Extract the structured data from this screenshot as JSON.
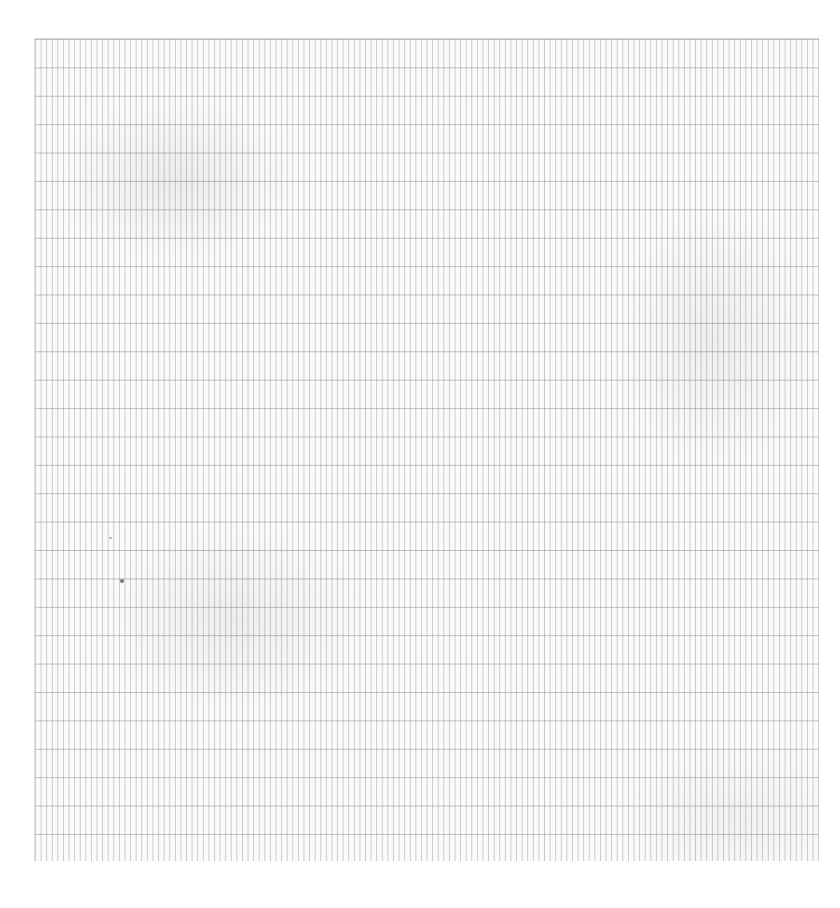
{
  "document": {
    "type": "blank graph paper scan",
    "grid": {
      "minor_vertical_spacing_px": 5.6,
      "major_horizontal_spacing_px": 28.4,
      "line_color": "#8c8c8c",
      "paper_color": "#fbfbfb"
    }
  }
}
